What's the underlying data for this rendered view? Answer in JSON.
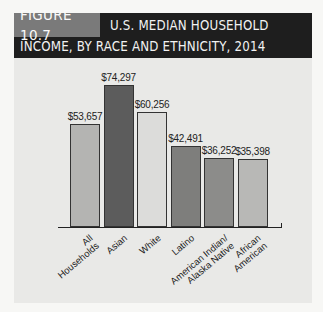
{
  "figure": {
    "label": "FIGURE 10.7",
    "title_line1": "U.S. MEDIAN HOUSEHOLD",
    "title_line2": "INCOME, BY RACE AND ETHNICITY, 2014"
  },
  "chart_data": {
    "type": "bar",
    "title": "U.S. Median Household Income, by Race and Ethnicity, 2014",
    "xlabel": "",
    "ylabel": "",
    "categories": [
      "All Households",
      "Asian",
      "White",
      "Latino",
      "American Indian/ Alaska Native",
      "African American"
    ],
    "values": [
      53657,
      74297,
      60256,
      42491,
      36252,
      35398
    ],
    "value_labels": [
      "$53,657",
      "$74,297",
      "$60,256",
      "$42,491",
      "$36,252",
      "$35,398"
    ],
    "colors": [
      "#b4b4b2",
      "#5c5c5c",
      "#dcdcda",
      "#7e7e7c",
      "#8c8c8a",
      "#b8b8b6"
    ],
    "ylim": [
      0,
      80000
    ],
    "grid": false,
    "legend": "none"
  },
  "labels": {
    "cat0_a": "All",
    "cat0_b": "Households",
    "cat1": "Asian",
    "cat2": "White",
    "cat3": "Latino",
    "cat4_a": "American Indian/",
    "cat4_b": "Alaska Native",
    "cat5_a": "African",
    "cat5_b": "American"
  }
}
